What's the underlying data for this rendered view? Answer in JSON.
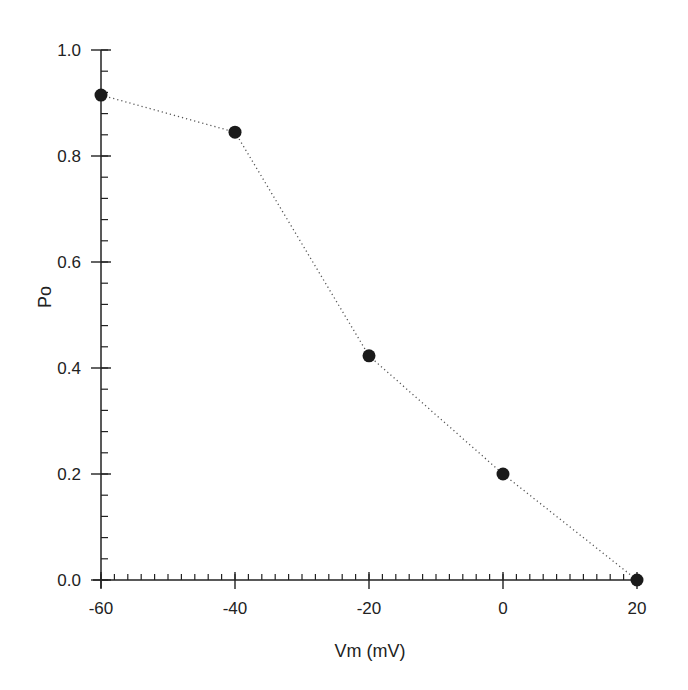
{
  "chart_data": {
    "type": "line",
    "title": "",
    "xlabel": "Vm (mV)",
    "ylabel": "Po",
    "x": [
      -60,
      -40,
      -20,
      0,
      20
    ],
    "series": [
      {
        "name": "Po",
        "values": [
          0.915,
          0.845,
          0.423,
          0.2,
          0.0
        ],
        "marker": "filled-circle",
        "line_style": "dotted"
      }
    ],
    "xlim": [
      -60,
      20
    ],
    "ylim": [
      0.0,
      1.0
    ],
    "x_ticks": [
      -60,
      -40,
      -20,
      0,
      20
    ],
    "x_tick_labels": [
      "-60",
      "-40",
      "-20",
      "0",
      "20"
    ],
    "x_minor_step": 2,
    "y_ticks": [
      0.0,
      0.2,
      0.4,
      0.6,
      0.8,
      1.0
    ],
    "y_tick_labels": [
      "0.0",
      "0.2",
      "0.4",
      "0.6",
      "0.8",
      "1.0"
    ],
    "y_minor_step": 0.04,
    "grid": false,
    "legend": null
  },
  "colors": {
    "axis": "#222222",
    "marker": "#1a1a1a",
    "line": "#555555",
    "background": "#ffffff"
  }
}
